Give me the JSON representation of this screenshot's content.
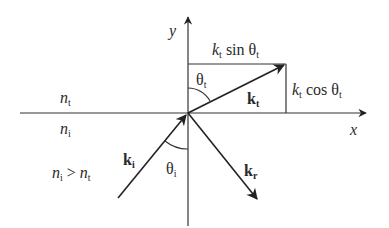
{
  "diagram": {
    "type": "refraction-wavevector-diagram",
    "axes": {
      "x_label": "x",
      "y_label": "y"
    },
    "media": {
      "top_medium": {
        "symbol": "n",
        "subscript": "t"
      },
      "bottom_medium": {
        "symbol": "n",
        "subscript": "i"
      },
      "condition": {
        "left": "n",
        "left_sub": "i",
        "op": ">",
        "right": "n",
        "right_sub": "t"
      }
    },
    "vectors": [
      {
        "id": "incident",
        "symbol": "k",
        "subscript": "i",
        "direction": "toward origin from lower-left"
      },
      {
        "id": "transmitted",
        "symbol": "k",
        "subscript": "t",
        "direction": "from origin to upper-right"
      },
      {
        "id": "reflected",
        "symbol": "k",
        "subscript": "r",
        "direction": "from origin to lower-right"
      }
    ],
    "angles": [
      {
        "id": "theta-t",
        "symbol": "θ",
        "subscript": "t"
      },
      {
        "id": "theta-i",
        "symbol": "θ",
        "subscript": "i"
      }
    ],
    "components": {
      "horizontal": {
        "k": "k",
        "k_sub": "t",
        "fn": "sin",
        "theta": "θ",
        "theta_sub": "t"
      },
      "vertical": {
        "k": "k",
        "k_sub": "t",
        "fn": "cos",
        "theta": "θ",
        "theta_sub": "t"
      }
    },
    "colors": {
      "line": "#333333",
      "text": "#2a2a2a",
      "background": "#ffffff"
    }
  }
}
